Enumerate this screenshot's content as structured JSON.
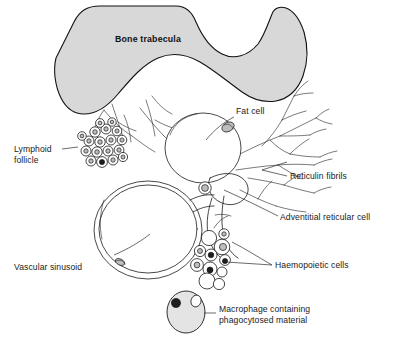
{
  "figure": {
    "background_color": "#ffffff",
    "ink_color": "#1a1a1a",
    "bone_fill_color": "#d8d8d8"
  },
  "labels": {
    "bone_trabecula": "Bone trabecula",
    "fat_cell": "Fat cell",
    "lymphoid_follicle_line1": "Lymphoid",
    "lymphoid_follicle_line2": "follicle",
    "reticulin_fibrils": "Reticulin fibrils",
    "adventitial_reticular_cell": "Adventitial reticular cell",
    "haemopoietic_cells": "Haemopoietic cells",
    "vascular_sinusoid": "Vascular sinusoid",
    "macrophage_line1": "Macrophage containing",
    "macrophage_line2": "phagocytosed material"
  }
}
